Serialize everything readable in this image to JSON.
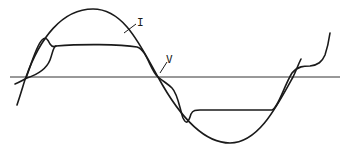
{
  "diagram": {
    "labels": {
      "current": "I",
      "voltage": "V"
    },
    "colors": {
      "stroke": "#1a1a1a",
      "axis": "#333333",
      "background": "#ffffff"
    },
    "series": [
      {
        "name": "I",
        "shape": "sine",
        "description": "Sinusoidal current waveform"
      },
      {
        "name": "V",
        "shape": "flat-topped with overshoot bumps",
        "description": "Distorted voltage waveform"
      }
    ]
  }
}
